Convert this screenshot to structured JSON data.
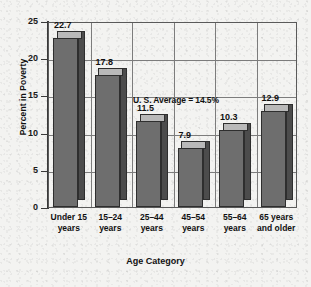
{
  "chart_data": {
    "type": "bar",
    "title": "",
    "xlabel": "Age Category",
    "ylabel": "Percent in Poverty",
    "categories": [
      "Under 15\nyears",
      "15–24\nyears",
      "25–44\nyears",
      "45–54\nyears",
      "55–64\nyears",
      "65 years\nand older"
    ],
    "values": [
      22.7,
      17.8,
      11.5,
      7.9,
      10.3,
      12.9
    ],
    "value_labels": [
      "22.7",
      "17.8",
      "11.5",
      "7.9",
      "10.3",
      "12.9"
    ],
    "ylim": [
      0,
      25
    ],
    "yticks": [
      0,
      5,
      10,
      15,
      20,
      25
    ],
    "ytick_labels": [
      "0",
      "5",
      "10",
      "15",
      "20",
      "25"
    ],
    "grid": true,
    "legend": "none",
    "annotations": [
      {
        "text": "U. S. Average = 14.5%",
        "value": 14.5
      }
    ],
    "colors": {
      "bar_front": "#6e6e6e",
      "bar_top": "#b9b9b9",
      "bar_side": "#4c4c4c",
      "bar_outline": "#2e2e2e",
      "grid": "#7c7c7c",
      "axis": "#3a3a3a",
      "text": "#111111",
      "background": "#f3f3f1"
    }
  }
}
